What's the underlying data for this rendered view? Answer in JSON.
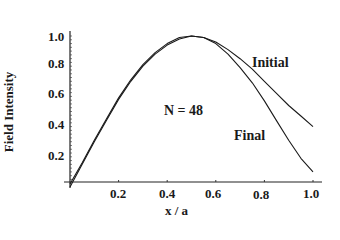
{
  "chart_data": {
    "type": "line",
    "title": "",
    "xlabel": "x / a",
    "ylabel": "Field Intensity",
    "xlim": [
      0,
      1.0
    ],
    "ylim": [
      0,
      1.0
    ],
    "grid": false,
    "legend": "inline annotations",
    "x_ticks": [
      "0.2",
      "0.4",
      "0.6",
      "0.8",
      "1.0"
    ],
    "y_ticks": [
      "0.2",
      "0.4",
      "0.6",
      "0.8",
      "1.0"
    ],
    "annotations": [
      "N = 48",
      "Initial",
      "Final"
    ],
    "x": [
      0.0,
      0.05,
      0.1,
      0.15,
      0.2,
      0.25,
      0.3,
      0.35,
      0.4,
      0.45,
      0.5,
      0.55,
      0.6,
      0.65,
      0.7,
      0.75,
      0.8,
      0.85,
      0.9,
      0.95,
      1.0
    ],
    "series": [
      {
        "name": "Initial",
        "values": [
          0.0,
          0.15,
          0.3,
          0.44,
          0.58,
          0.7,
          0.8,
          0.88,
          0.94,
          0.98,
          1.0,
          0.99,
          0.96,
          0.91,
          0.85,
          0.78,
          0.7,
          0.62,
          0.54,
          0.47,
          0.4
        ]
      },
      {
        "name": "Final",
        "values": [
          0.02,
          0.16,
          0.31,
          0.45,
          0.59,
          0.71,
          0.81,
          0.89,
          0.95,
          0.99,
          1.0,
          0.99,
          0.95,
          0.88,
          0.79,
          0.69,
          0.57,
          0.44,
          0.31,
          0.19,
          0.1
        ]
      }
    ]
  },
  "labels": {
    "ylabel": "Field Intensity",
    "xlabel": "x / a",
    "n_annotation": "N = 48",
    "initial": "Initial",
    "final": "Final",
    "x_ticks": [
      "0.2",
      "0.4",
      "0.6",
      "0.8",
      "1.0"
    ],
    "y_ticks": [
      "0.2",
      "0.4",
      "0.6",
      "0.8",
      "1.0"
    ]
  }
}
